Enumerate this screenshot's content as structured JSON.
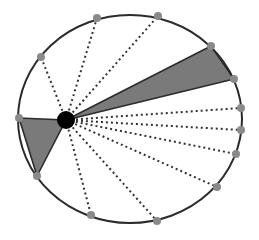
{
  "diagram": {
    "colors": {
      "background": "#ffffff",
      "outline": "#2b2b2b",
      "boundary_point": "#8a8a8a",
      "shaded_region": "#7a7a7a",
      "center_point": "#000000",
      "dotted_line": "#333333"
    },
    "ellipse": {
      "cx": 130,
      "cy": 119,
      "rx": 112,
      "ry": 104
    },
    "center_point": {
      "x": 66,
      "y": 120,
      "r": 9
    },
    "boundary_points": [
      {
        "x": 41,
        "y": 57
      },
      {
        "x": 97,
        "y": 18
      },
      {
        "x": 158,
        "y": 16
      },
      {
        "x": 211,
        "y": 46
      },
      {
        "x": 234,
        "y": 79
      },
      {
        "x": 241,
        "y": 108
      },
      {
        "x": 241,
        "y": 130
      },
      {
        "x": 236,
        "y": 154
      },
      {
        "x": 217,
        "y": 187
      },
      {
        "x": 157,
        "y": 221
      },
      {
        "x": 91,
        "y": 215
      },
      {
        "x": 37,
        "y": 176
      },
      {
        "x": 19,
        "y": 118
      }
    ],
    "shaded_triangles": [
      {
        "from": 3,
        "to": 4
      },
      {
        "from": 11,
        "to": 12
      }
    ],
    "dotted_lines_to": [
      0,
      1,
      2,
      5,
      6,
      7,
      8,
      9,
      10
    ]
  }
}
